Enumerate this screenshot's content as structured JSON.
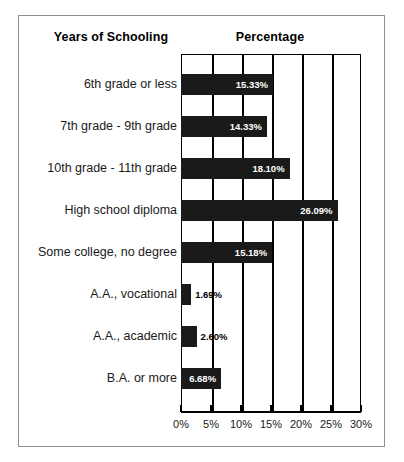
{
  "headers": {
    "category_header": "Years of Schooling",
    "value_header": "Percentage"
  },
  "chart_data": {
    "type": "bar",
    "orientation": "horizontal",
    "title": "",
    "subtitle": "",
    "xlabel": "Percentage",
    "ylabel": "Years of Schooling",
    "xlim": [
      0,
      30
    ],
    "xunit": "%",
    "grid": true,
    "legend": null,
    "bar_color": "#1a1a1a",
    "categories": [
      "6th grade or less",
      "7th grade - 9th grade",
      "10th grade - 11th grade",
      "High school diploma",
      "Some college, no degree",
      "A.A., vocational",
      "A.A., academic",
      "B.A. or more"
    ],
    "values": [
      15.33,
      14.33,
      18.1,
      26.09,
      15.18,
      1.69,
      2.6,
      6.68
    ],
    "value_labels": [
      "15.33%",
      "14.33%",
      "18.10%",
      "26.09%",
      "15.18%",
      "1.69%",
      "2.60%",
      "6.68%"
    ],
    "label_placement": [
      "inside",
      "inside",
      "inside",
      "inside",
      "inside",
      "outside",
      "outside",
      "inside"
    ],
    "xticks": [
      0,
      5,
      10,
      15,
      20,
      25,
      30
    ],
    "xticklabels": [
      "0%",
      "5%",
      "10%",
      "15%",
      "20%",
      "25%",
      "30%"
    ]
  }
}
